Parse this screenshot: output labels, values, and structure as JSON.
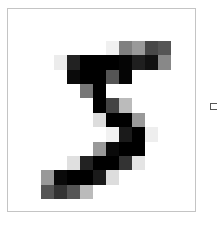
{
  "image": {
    "description": "Pixelated grayscale handwritten digit",
    "digit": "5",
    "grid": {
      "rows": 11,
      "cols": 10,
      "background": "#ffffff",
      "cells": [
        [
          "#ffffff",
          "#ffffff",
          "#ffffff",
          "#ffffff",
          "#ffffff",
          "#f0f0f0",
          "#808080",
          "#9a9a9a",
          "#484848",
          "#555555"
        ],
        [
          "#ffffff",
          "#ececec",
          "#222222",
          "#000000",
          "#000000",
          "#000000",
          "#050505",
          "#1f1f1f",
          "#111111",
          "#888888"
        ],
        [
          "#ffffff",
          "#ffffff",
          "#0a0a0a",
          "#000000",
          "#000000",
          "#555555",
          "#050505",
          "#ffffff",
          "#ffffff",
          "#ffffff"
        ],
        [
          "#ffffff",
          "#ffffff",
          "#ffffff",
          "#777777",
          "#000000",
          "#ffffff",
          "#ffffff",
          "#ffffff",
          "#ffffff",
          "#ffffff"
        ],
        [
          "#ffffff",
          "#ffffff",
          "#ffffff",
          "#ffffff",
          "#000000",
          "#444444",
          "#bbbbbb",
          "#ffffff",
          "#ffffff",
          "#ffffff"
        ],
        [
          "#ffffff",
          "#ffffff",
          "#ffffff",
          "#ffffff",
          "#dddddd",
          "#000000",
          "#000000",
          "#999999",
          "#ffffff",
          "#ffffff"
        ],
        [
          "#ffffff",
          "#ffffff",
          "#ffffff",
          "#ffffff",
          "#ffffff",
          "#f2f2f2",
          "#1a1a1a",
          "#000000",
          "#eeeeee",
          "#ffffff"
        ],
        [
          "#ffffff",
          "#ffffff",
          "#ffffff",
          "#ffffff",
          "#999999",
          "#0a0a0a",
          "#000000",
          "#000000",
          "#ffffff",
          "#ffffff"
        ],
        [
          "#ffffff",
          "#ffffff",
          "#e0e0e0",
          "#222222",
          "#000000",
          "#000000",
          "#333333",
          "#e4e4e4",
          "#ffffff",
          "#ffffff"
        ],
        [
          "#999999",
          "#0a0a0a",
          "#000000",
          "#000000",
          "#1a1a1a",
          "#dddddd",
          "#ffffff",
          "#ffffff",
          "#ffffff",
          "#ffffff"
        ],
        [
          "#555555",
          "#333333",
          "#555555",
          "#bbbbbb",
          "#ffffff",
          "#ffffff",
          "#ffffff",
          "#ffffff",
          "#ffffff",
          "#ffffff"
        ]
      ]
    }
  },
  "frame": {
    "border_color": "#c4c4c4"
  },
  "checkbox": {
    "checked": false
  }
}
